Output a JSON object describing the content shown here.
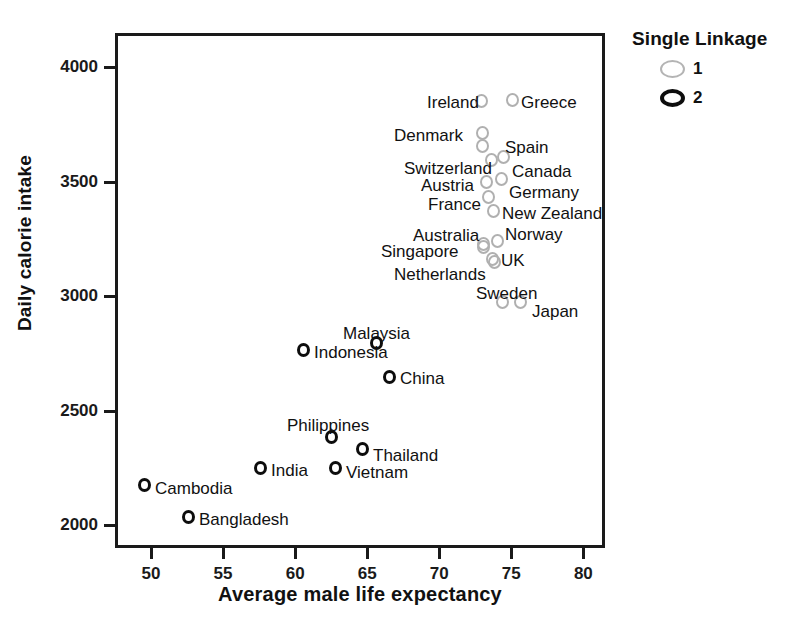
{
  "chart_data": {
    "type": "scatter",
    "title": "",
    "xlabel": "Average male life expectancy",
    "ylabel": "Daily calorie intake",
    "xlim": [
      47.5,
      81.5
    ],
    "ylim": [
      1900,
      4150
    ],
    "xticks": [
      50,
      55,
      60,
      65,
      70,
      75,
      80
    ],
    "yticks": [
      2000,
      2500,
      3000,
      3500,
      4000
    ],
    "grid": false,
    "legend": {
      "title": "Single Linkage",
      "position": "top-right-outside",
      "entries": [
        {
          "label": "1",
          "cluster": 1,
          "color": "#b0b0b0",
          "style": "open-circle-gray"
        },
        {
          "label": "2",
          "cluster": 2,
          "color": "#0d0d0d",
          "style": "open-circle-black"
        }
      ]
    },
    "series": [
      {
        "name": "1",
        "cluster": 1,
        "color": "#b0b0b0",
        "points": [
          {
            "label": "Ireland",
            "x": 72.8,
            "y": 3815,
            "px": 481,
            "py": 101,
            "lx": 427,
            "ly": 94,
            "anchor": "left"
          },
          {
            "label": "Greece",
            "x": 75.0,
            "y": 3780,
            "px": 512,
            "py": 100,
            "lx": 521,
            "ly": 94,
            "anchor": "left"
          },
          {
            "label": "Denmark",
            "x": 73.0,
            "y": 3640,
            "px": 482,
            "py": 133,
            "lx": 394,
            "ly": 127,
            "anchor": "left"
          },
          {
            "label": "Spain",
            "x": 73.0,
            "y": 3590,
            "px": 482,
            "py": 146,
            "lx": 505,
            "ly": 139,
            "anchor": "left"
          },
          {
            "label": "Canada",
            "x": 74.6,
            "y": 3550,
            "px": 503,
            "py": 157,
            "lx": 512,
            "ly": 163,
            "anchor": "left"
          },
          {
            "label": "Switzerland",
            "x": 73.6,
            "y": 3540,
            "px": 491,
            "py": 160,
            "lx": 404,
            "ly": 160,
            "anchor": "left"
          },
          {
            "label": "Austria",
            "x": 73.3,
            "y": 3500,
            "px": 486,
            "py": 182,
            "lx": 421,
            "ly": 177,
            "anchor": "left"
          },
          {
            "label": "Germany",
            "x": 74.5,
            "y": 3505,
            "px": 501,
            "py": 179,
            "lx": 509,
            "ly": 184,
            "anchor": "left"
          },
          {
            "label": "France",
            "x": 73.4,
            "y": 3430,
            "px": 488,
            "py": 197,
            "lx": 428,
            "ly": 196,
            "anchor": "left"
          },
          {
            "label": "New Zealand",
            "x": 73.8,
            "y": 3390,
            "px": 493,
            "py": 211,
            "lx": 502,
            "ly": 205,
            "anchor": "left"
          },
          {
            "label": "Norway",
            "x": 74.3,
            "y": 3300,
            "px": 497,
            "py": 241,
            "lx": 505,
            "ly": 226,
            "anchor": "left"
          },
          {
            "label": "Australia",
            "x": 73.0,
            "y": 3280,
            "px": 483,
            "py": 244,
            "lx": 413,
            "ly": 227,
            "anchor": "left"
          },
          {
            "label": "Singapore",
            "x": 73.0,
            "y": 3270,
            "px": 483,
            "py": 247,
            "lx": 381,
            "ly": 243,
            "anchor": "left"
          },
          {
            "label": "UK",
            "x": 73.7,
            "y": 3215,
            "px": 492,
            "py": 259,
            "lx": 501,
            "ly": 252,
            "anchor": "left"
          },
          {
            "label": "Netherlands",
            "x": 74.0,
            "y": 3150,
            "px": 494,
            "py": 262,
            "lx": 394,
            "ly": 266,
            "anchor": "left"
          },
          {
            "label": "Sweden",
            "x": 74.9,
            "y": 2960,
            "px": 502,
            "py": 302,
            "lx": 476,
            "ly": 285,
            "anchor": "left"
          },
          {
            "label": "Japan",
            "x": 76.0,
            "y": 2960,
            "px": 520,
            "py": 302,
            "lx": 532,
            "ly": 303,
            "anchor": "left"
          }
        ]
      },
      {
        "name": "2",
        "cluster": 2,
        "color": "#0d0d0d",
        "points": [
          {
            "label": "Malaysia",
            "x": 66.3,
            "y": 2790,
            "px": 376,
            "py": 343,
            "lx": 343,
            "ly": 325,
            "anchor": "left"
          },
          {
            "label": "Indonesia",
            "x": 61.0,
            "y": 2720,
            "px": 303,
            "py": 350,
            "lx": 314,
            "ly": 344,
            "anchor": "left"
          },
          {
            "label": "China",
            "x": 67.2,
            "y": 2630,
            "px": 389,
            "py": 377,
            "lx": 400,
            "ly": 370,
            "anchor": "left"
          },
          {
            "label": "Philippines",
            "x": 63.2,
            "y": 2375,
            "px": 331,
            "py": 437,
            "lx": 287,
            "ly": 417,
            "anchor": "left"
          },
          {
            "label": "Thailand",
            "x": 65.0,
            "y": 2320,
            "px": 362,
            "py": 449,
            "lx": 373,
            "ly": 447,
            "anchor": "left"
          },
          {
            "label": "India",
            "x": 58.0,
            "y": 2225,
            "px": 260,
            "py": 468,
            "lx": 271,
            "ly": 462,
            "anchor": "left"
          },
          {
            "label": "Vietnam",
            "x": 63.3,
            "y": 2240,
            "px": 335,
            "py": 468,
            "lx": 346,
            "ly": 464,
            "anchor": "left"
          },
          {
            "label": "Cambodia",
            "x": 50.0,
            "y": 2160,
            "px": 144,
            "py": 485,
            "lx": 155,
            "ly": 480,
            "anchor": "left"
          },
          {
            "label": "Bangladesh",
            "x": 53.0,
            "y": 2015,
            "px": 188,
            "py": 517,
            "lx": 199,
            "ly": 511,
            "anchor": "left"
          }
        ]
      }
    ]
  }
}
